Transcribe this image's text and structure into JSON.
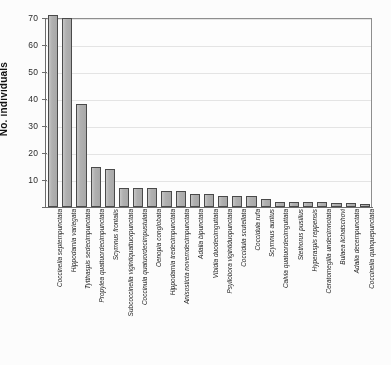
{
  "chart_data": {
    "type": "bar",
    "title": "",
    "xlabel": "",
    "ylabel": "No. individuals",
    "ylim": [
      0,
      70
    ],
    "yticks": [
      0,
      10,
      20,
      30,
      40,
      50,
      60,
      70
    ],
    "grid": true,
    "legend": false,
    "orientation": "vertical",
    "bar_color": "#b4b4b4",
    "bar_edge_color": "#4a4a4a",
    "axis_color": "#6d6d6d",
    "gridline_color": "#e4e4e4",
    "categories": [
      "Coccinella septempunctata",
      "Hippodamia variegata",
      "Tytthaspis sedecimpunctata",
      "Propylea quattuordecimpunctata",
      "Scymnus frontalis",
      "Subcoccinella vigintiquattuorpunctata",
      "Coccinula quatuordecimpustulata",
      "Oenopia conglobata",
      "Hippodamia tredecimpunctata",
      "Anisosticta novemdecimpunctata",
      "Adalia bipunctata",
      "Vibidia duodecimguttata",
      "Psyllobora vigintiduopunctata",
      "Coccidula scutellata",
      "Coccidula rufa",
      "Scymnus auritus",
      "Calvia quatuordecimguttata",
      "Stethorus pusillus",
      "Hyperaspis reppensis",
      "Ceratomegilla undecimnotata",
      "Bulaea lichatschovi",
      "Adalia decempunctata",
      "Coccinella quinquepunctata"
    ],
    "values": [
      71,
      70,
      38,
      15,
      14,
      7,
      7,
      7,
      6,
      6,
      5,
      5,
      4,
      4,
      4,
      3,
      2,
      2,
      2,
      2,
      1.5,
      1.5,
      1
    ]
  }
}
